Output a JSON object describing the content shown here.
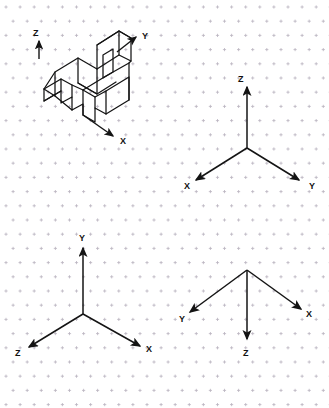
{
  "sheet": {
    "title": "Isometric dot-grid worksheet",
    "background_color": "#ffffff",
    "grid": {
      "type": "isometric-dot",
      "dot_color": "#b9b2bf",
      "spacing_x": 14.1,
      "spacing_y": 14.2,
      "origin_x": 6,
      "origin_y": 7,
      "glyph": "plus-dot"
    },
    "line_color": "#141414"
  },
  "figures": [
    {
      "id": "figure-1",
      "name": "isometric-v-block-object",
      "kind": "pictorial",
      "description": "V-block / saddle bracket drawn in isometric projection",
      "axes": [
        {
          "label": "Z",
          "label_x": 33,
          "label_y": 33,
          "from_x": 39,
          "from_y": 59,
          "to_x": 39,
          "to_y": 40,
          "direction": "up"
        },
        {
          "label": "Y",
          "label_x": 142,
          "label_y": 36,
          "from_x": 117,
          "from_y": 52,
          "to_x": 136,
          "to_y": 37,
          "direction": "up-right"
        },
        {
          "label": "X",
          "label_x": 121,
          "label_y": 141,
          "from_x": 83,
          "from_y": 115,
          "to_x": 113,
          "to_y": 136,
          "direction": "down-right"
        }
      ]
    },
    {
      "id": "figure-2",
      "name": "axis-triad-z-up",
      "kind": "coordinate-triad",
      "origin_x": 247,
      "origin_y": 148,
      "axes": [
        {
          "label": "Z",
          "label_x": 238,
          "label_y": 79,
          "to_x": 247,
          "to_y": 86,
          "direction": "up"
        },
        {
          "label": "X",
          "label_x": 185,
          "label_y": 186,
          "to_x": 196,
          "to_y": 180,
          "direction": "down-left"
        },
        {
          "label": "Y",
          "label_x": 310,
          "label_y": 186,
          "to_x": 299,
          "to_y": 180,
          "direction": "down-right"
        }
      ]
    },
    {
      "id": "figure-3",
      "name": "axis-triad-y-up",
      "kind": "coordinate-triad",
      "origin_x": 83,
      "origin_y": 314,
      "axes": [
        {
          "label": "Y",
          "label_x": 80,
          "label_y": 238,
          "to_x": 83,
          "to_y": 247,
          "direction": "up"
        },
        {
          "label": "Z",
          "label_x": 17,
          "label_y": 355,
          "to_x": 29,
          "to_y": 347,
          "direction": "down-left"
        },
        {
          "label": "X",
          "label_x": 146,
          "label_y": 351,
          "to_x": 139,
          "to_y": 345,
          "direction": "down-right"
        }
      ]
    },
    {
      "id": "figure-4",
      "name": "axis-triad-z-down",
      "kind": "coordinate-triad",
      "origin_x": 247,
      "origin_y": 270,
      "axes": [
        {
          "label": "Y",
          "label_x": 180,
          "label_y": 319,
          "to_x": 190,
          "to_y": 312,
          "direction": "down-left"
        },
        {
          "label": "X",
          "label_x": 307,
          "label_y": 314,
          "to_x": 301,
          "to_y": 309,
          "direction": "down-right"
        },
        {
          "label": "Z",
          "label_x": 244,
          "label_y": 355,
          "to_x": 247,
          "to_y": 338,
          "direction": "down"
        }
      ]
    }
  ],
  "labels": {
    "x": "X",
    "y": "Y",
    "z": "Z"
  }
}
